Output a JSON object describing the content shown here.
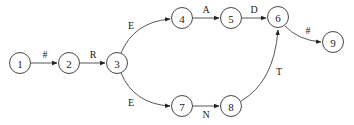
{
  "diagram": {
    "type": "state-transition-graph",
    "nodes": [
      {
        "id": "1",
        "label": "1",
        "x": 20,
        "y": 63
      },
      {
        "id": "2",
        "label": "2",
        "x": 69,
        "y": 63
      },
      {
        "id": "3",
        "label": "3",
        "x": 117,
        "y": 63
      },
      {
        "id": "4",
        "label": "4",
        "x": 182,
        "y": 18
      },
      {
        "id": "5",
        "label": "5",
        "x": 231,
        "y": 18
      },
      {
        "id": "6",
        "label": "6",
        "x": 278,
        "y": 17
      },
      {
        "id": "7",
        "label": "7",
        "x": 182,
        "y": 106
      },
      {
        "id": "8",
        "label": "8",
        "x": 231,
        "y": 106
      },
      {
        "id": "9",
        "label": "9",
        "x": 333,
        "y": 42
      }
    ],
    "edges": [
      {
        "from": "1",
        "to": "2",
        "label": "#"
      },
      {
        "from": "2",
        "to": "3",
        "label": "R"
      },
      {
        "from": "3",
        "to": "4",
        "label": "E"
      },
      {
        "from": "4",
        "to": "5",
        "label": "A"
      },
      {
        "from": "5",
        "to": "6",
        "label": "D"
      },
      {
        "from": "6",
        "to": "9",
        "label": "#"
      },
      {
        "from": "3",
        "to": "7",
        "label": "E"
      },
      {
        "from": "7",
        "to": "8",
        "label": "N"
      },
      {
        "from": "8",
        "to": "6",
        "label": "T"
      }
    ]
  }
}
